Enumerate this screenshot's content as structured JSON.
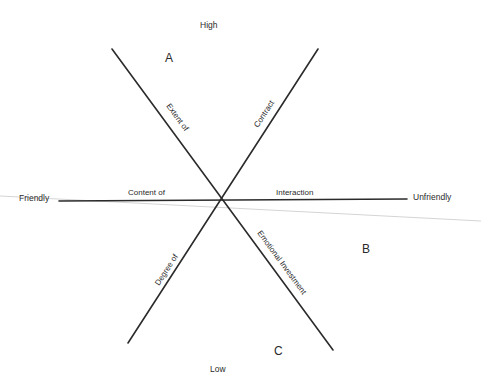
{
  "diagram": {
    "type": "three-axis interpersonal dimension diagram",
    "poles": {
      "top": "High",
      "bottom": "Low",
      "left": "Friendly",
      "right": "Unfriendly"
    },
    "regions": {
      "a": "A",
      "b": "B",
      "c": "C"
    },
    "axis_labels": {
      "upper_left": "Extent of",
      "upper_right": "Contract",
      "left_horizontal": "Content of",
      "right_horizontal": "Interaction",
      "lower_left": "Degree of",
      "lower_right": "Emotional Investment"
    },
    "axes": [
      {
        "name": "diagonal-descending",
        "from": [
          112,
          49
        ],
        "to": [
          333,
          350
        ]
      },
      {
        "name": "diagonal-ascending",
        "from": [
          318,
          49
        ],
        "to": [
          128,
          343
        ]
      },
      {
        "name": "horizontal",
        "from": [
          59,
          201
        ],
        "to": [
          407,
          199
        ]
      }
    ],
    "center": [
      221,
      200
    ],
    "colors": {
      "line": "#2b2b2b",
      "text": "#2a2a2a",
      "background": "#ffffff",
      "scan_artifact": "#c9c9c9"
    }
  }
}
